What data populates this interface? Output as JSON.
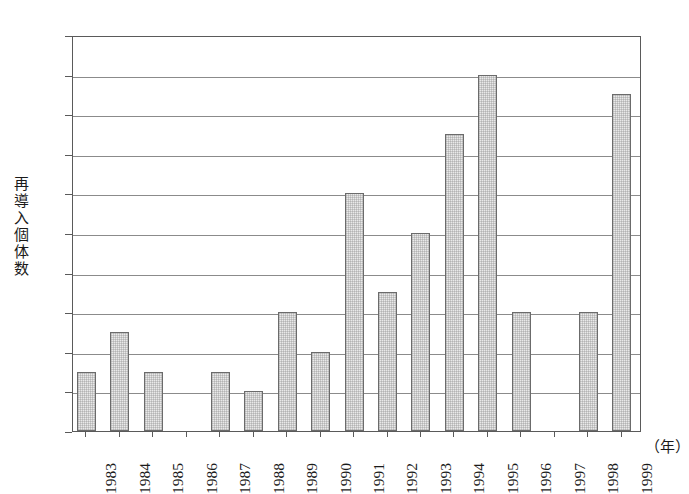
{
  "chart_data": {
    "type": "bar",
    "title": "",
    "subtitle": "",
    "xlabel": "（年）",
    "ylabel": "再導入個体数",
    "categories": [
      "1983",
      "1984",
      "1985",
      "1986",
      "1987",
      "1988",
      "1989",
      "1990",
      "1991",
      "1992",
      "1993",
      "1994",
      "1995",
      "1996",
      "1997",
      "1998",
      "1999"
    ],
    "values": [
      3,
      5,
      3,
      0,
      3,
      2,
      6,
      4,
      12,
      7,
      10,
      15,
      18,
      6,
      0,
      6,
      17
    ],
    "ylim": [
      0,
      20
    ],
    "y_ticks": [
      0,
      2,
      4,
      6,
      8,
      10,
      12,
      14,
      16,
      18,
      20
    ],
    "y_tick_labels": [
      "0",
      "2",
      "4",
      "6",
      "8",
      "10",
      "12",
      "14",
      "16",
      "18",
      "20"
    ],
    "grid": true,
    "grid_axis": "y",
    "legend": null,
    "legend_position": "none",
    "bar_fill_color": "#e9e9e9",
    "bar_edge_color": "#6b6b6b",
    "frame_color": "#5a5a5a",
    "gridline_color": "#8b8b8b",
    "background_color": "#ffffff",
    "annotations": []
  },
  "axis": {
    "y_title_chars": [
      "再",
      "導",
      "入",
      "個",
      "体",
      "数"
    ],
    "x_unit_label": "（年）"
  }
}
